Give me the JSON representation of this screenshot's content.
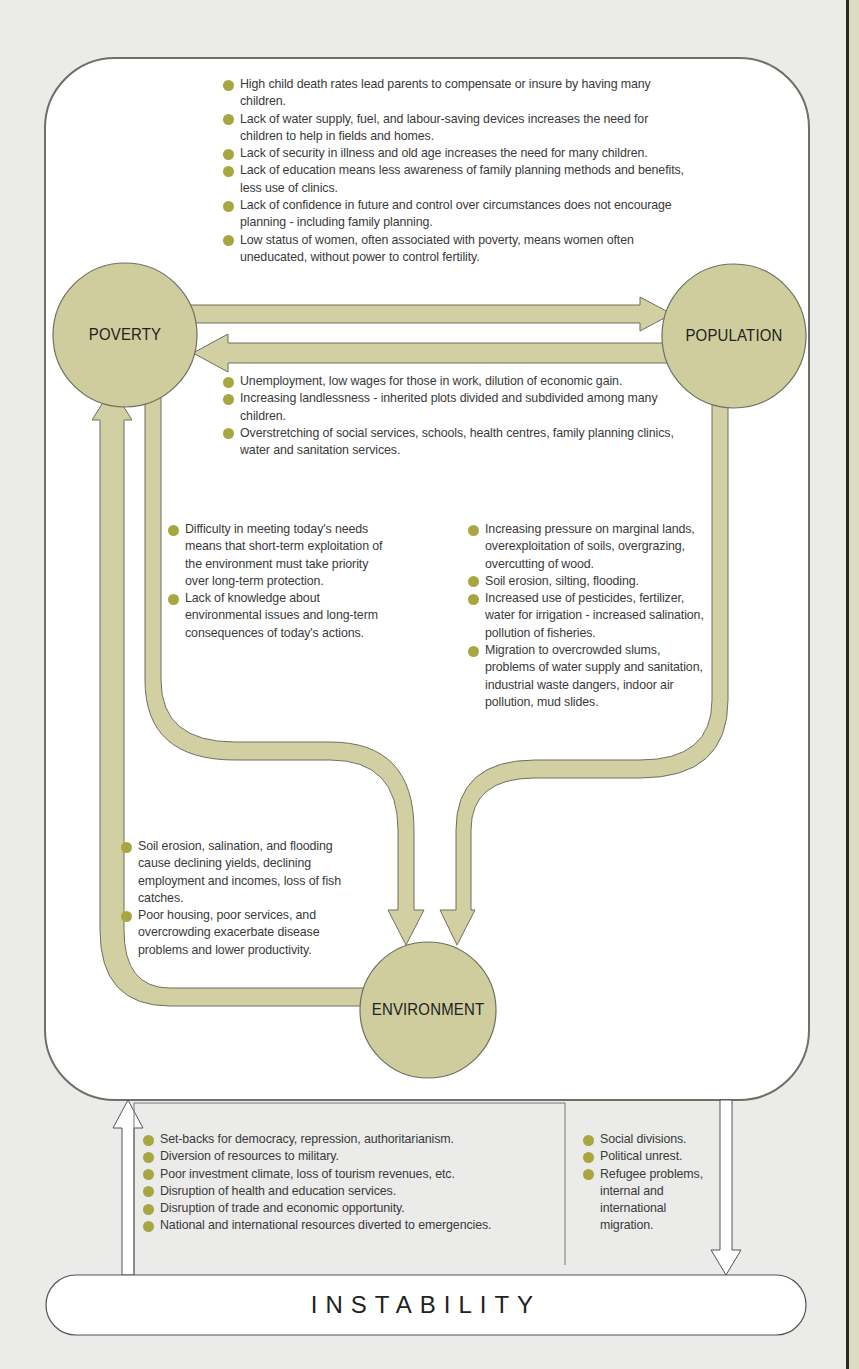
{
  "colors": {
    "node_fill": "#cfcc9e",
    "arrow_fill": "#d2cfa3",
    "bullet": "#a8a640",
    "panel_bg": "#ffffff",
    "page_bg": "#ebebea",
    "outline": "#6f6f60"
  },
  "nodes": {
    "poverty": "POVERTY",
    "population": "POPULATION",
    "environment": "ENVIRONMENT",
    "instability": "INSTABILITY"
  },
  "sections": {
    "poverty_to_population": [
      "High child death rates lead parents to compensate or insure by having many children.",
      "Lack of water supply, fuel, and labour-saving devices increases the need for children to help in fields and homes.",
      "Lack of security in illness and old age increases the need for many children.",
      "Lack of education means less awareness of family planning methods and benefits, less use of clinics.",
      "Lack of confidence in future and control over circumstances does not encourage planning - including family planning.",
      "Low status of women, often associated with poverty, means women often uneducated, without power to control fertility."
    ],
    "population_to_poverty": [
      "Unemployment, low wages for those in work, dilution of economic gain.",
      "Increasing landlessness - inherited plots divided and subdivided among many children.",
      "Overstretching of social services, schools, health centres, family planning clinics, water and sanitation services."
    ],
    "poverty_to_environment": [
      "Difficulty in meeting today's needs means that short-term exploitation of the environment must take priority over long-term protection.",
      "Lack of knowledge about environmental issues and long-term consequences of today's actions."
    ],
    "population_to_environment": [
      "Increasing pressure on marginal lands, overexploitation of soils, overgrazing, overcutting of wood.",
      "Soil erosion, silting, flooding.",
      "Increased use of pesticides, fertilizer, water for irrigation - increased salination, pollution of fisheries.",
      "Migration to overcrowded slums, problems of water supply and sanitation, industrial waste dangers, indoor air pollution, mud slides."
    ],
    "environment_to_poverty": [
      "Soil erosion, salination, and flooding cause declining yields, declining employment and incomes, loss of fish catches.",
      "Poor housing, poor services, and overcrowding exacerbate disease problems and lower productivity."
    ],
    "instability_to_system": [
      "Set-backs for democracy, repression, authoritarianism.",
      "Diversion of resources to military.",
      "Poor investment climate, loss of tourism revenues, etc.",
      "Disruption of health and education services.",
      "Disruption of trade and economic opportunity.",
      "National and international resources diverted to emergencies."
    ],
    "system_to_instability": [
      "Social divisions.",
      "Political unrest.",
      "Refugee problems, internal and international migration."
    ]
  }
}
